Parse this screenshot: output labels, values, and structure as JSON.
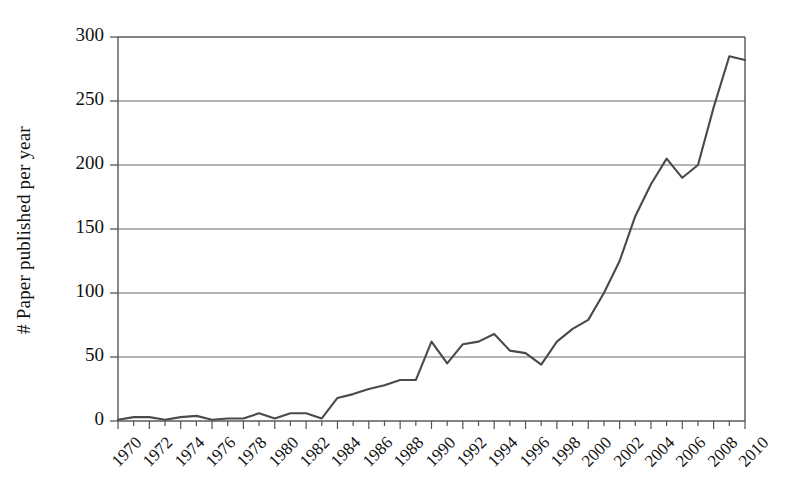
{
  "chart_data": {
    "type": "line",
    "title": "",
    "subtitle": "",
    "xlabel": "",
    "ylabel": "# Paper published per year",
    "xlim": [
      1970,
      2010
    ],
    "ylim": [
      0,
      300
    ],
    "grid": true,
    "grid_axis": "y",
    "legend": false,
    "legend_position": "none",
    "line_color": "#4a4a4a",
    "frame_color": "#555555",
    "grid_color": "#6b6b6b",
    "background": "#ffffff",
    "ytick_labels": [
      "0",
      "50",
      "100",
      "150",
      "200",
      "250",
      "300"
    ],
    "ytick_values": [
      0,
      50,
      100,
      150,
      200,
      250,
      300
    ],
    "xtick_labels": [
      "1970",
      "1972",
      "1974",
      "1976",
      "1978",
      "1980",
      "1982",
      "1984",
      "1986",
      "1988",
      "1990",
      "1992",
      "1994",
      "1996",
      "1998",
      "2000",
      "2002",
      "2004",
      "2006",
      "2008",
      "2010"
    ],
    "xtick_values": [
      1970,
      1972,
      1974,
      1976,
      1978,
      1980,
      1982,
      1984,
      1986,
      1988,
      1990,
      1992,
      1994,
      1996,
      1998,
      2000,
      2002,
      2004,
      2006,
      2008,
      2010
    ],
    "xtick_label_rotation": -45,
    "minor_xticks_every": 1,
    "x": [
      1970,
      1971,
      1972,
      1973,
      1974,
      1975,
      1976,
      1977,
      1978,
      1979,
      1980,
      1981,
      1982,
      1983,
      1984,
      1985,
      1986,
      1987,
      1988,
      1989,
      1990,
      1991,
      1992,
      1993,
      1994,
      1995,
      1996,
      1997,
      1998,
      1999,
      2000,
      2001,
      2002,
      2003,
      2004,
      2005,
      2006,
      2007,
      2008,
      2009,
      2010
    ],
    "values": [
      1,
      3,
      3,
      1,
      3,
      4,
      1,
      2,
      2,
      6,
      2,
      6,
      6,
      2,
      18,
      21,
      25,
      28,
      32,
      32,
      62,
      45,
      60,
      62,
      68,
      55,
      53,
      44,
      62,
      72,
      79,
      100,
      125,
      160,
      185,
      205,
      190,
      200,
      245,
      285,
      282
    ],
    "series": [
      {
        "name": "Papers published per year",
        "values": [
          1,
          3,
          3,
          1,
          3,
          4,
          1,
          2,
          2,
          6,
          2,
          6,
          6,
          2,
          18,
          21,
          25,
          28,
          32,
          32,
          62,
          45,
          60,
          62,
          68,
          55,
          53,
          44,
          62,
          72,
          79,
          100,
          125,
          160,
          185,
          205,
          190,
          200,
          245,
          285,
          282
        ]
      }
    ]
  }
}
